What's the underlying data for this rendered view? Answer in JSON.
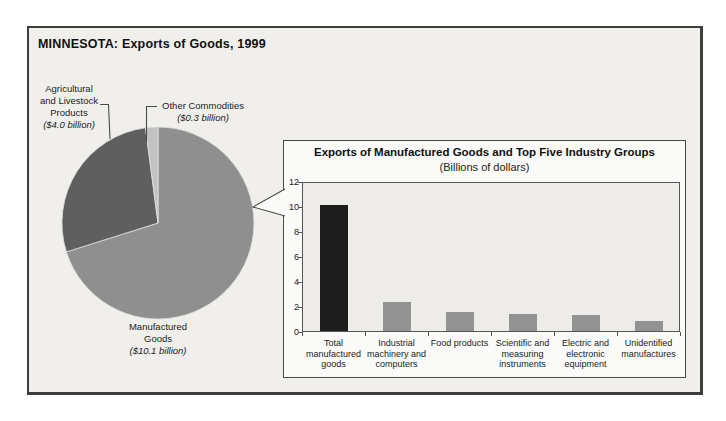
{
  "page": {
    "title": "MINNESOTA: Exports of Goods, 1999"
  },
  "pie_labels": {
    "agricultural": {
      "line1": "Agricultural",
      "line2": "and Livestock",
      "line3": "Products",
      "value_line": "($4.0 billion)"
    },
    "other": {
      "line1": "Other Commodities",
      "value_line": "($0.3 billion)"
    },
    "manufactured": {
      "line1": "Manufactured",
      "line2": "Goods",
      "value_line": "($10.1 billion)"
    }
  },
  "bar_panel": {
    "title": "Exports of Manufactured Goods and Top Five Industry Groups",
    "subtitle": "(Billions of dollars)"
  },
  "chart_data": [
    {
      "type": "pie",
      "title": "MINNESOTA: Exports of Goods, 1999",
      "units": "billions of dollars",
      "total": 14.4,
      "start_angle_from_north_deg": 0,
      "direction": "clockwise",
      "slices": [
        {
          "label": "Manufactured Goods",
          "value": 10.1,
          "display": "$10.1 billion",
          "color": "#8f8f8f"
        },
        {
          "label": "Agricultural and Livestock Products",
          "value": 4.0,
          "display": "$4.0 billion",
          "color": "#5f5f5f"
        },
        {
          "label": "Other Commodities",
          "value": 0.3,
          "display": "$0.3 billion",
          "color": "#c2c2c2"
        }
      ]
    },
    {
      "type": "bar",
      "title": "Exports of Manufactured Goods and Top Five Industry Groups",
      "subtitle": "(Billions of dollars)",
      "categories": [
        "Total manufactured goods",
        "Industrial machinery and computers",
        "Food products",
        "Scientific and measuring instruments",
        "Electric and electronic equipment",
        "Unidentified manufactures"
      ],
      "category_label_lines": [
        [
          "Total",
          "manufactured",
          "goods"
        ],
        [
          "Industrial",
          "machinery and",
          "computers"
        ],
        [
          "Food products"
        ],
        [
          "Scientific and",
          "measuring",
          "instruments"
        ],
        [
          "Electric and",
          "electronic",
          "equipment"
        ],
        [
          "Unidentified",
          "manufactures"
        ]
      ],
      "values": [
        10.1,
        2.3,
        1.5,
        1.4,
        1.3,
        0.8
      ],
      "bar_colors": [
        "#1d1d1d",
        "#929292",
        "#929292",
        "#929292",
        "#929292",
        "#929292"
      ],
      "ylabel": "",
      "xlabel": "",
      "ylim": [
        0,
        12
      ],
      "yticks": [
        0,
        2,
        4,
        6,
        8,
        10,
        12
      ],
      "grid": false,
      "legend": false
    }
  ]
}
